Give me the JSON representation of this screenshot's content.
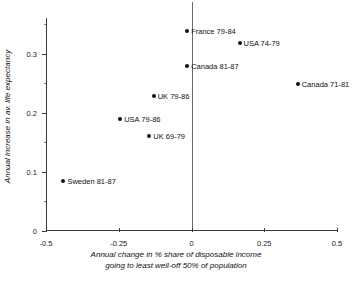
{
  "chart_data": {
    "type": "scatter",
    "title": "",
    "xlabel": "Annual change in % share of disposable income going to least well-off 50% of population",
    "xlabel_line1": "Annual change in % share of disposable income",
    "xlabel_line2": "going to least well-off 50% of population",
    "ylabel": "Annual increase in av. life expectancy",
    "xlim": [
      -0.5,
      0.5
    ],
    "ylim": [
      0,
      0.36
    ],
    "xticks": [
      -0.5,
      -0.25,
      0,
      0.25,
      0.5
    ],
    "xticklabels": [
      "-0.5",
      "-0.25",
      "0",
      "0.25",
      "0.5"
    ],
    "yticks": [
      0,
      0.1,
      0.2,
      0.3
    ],
    "yticklabels": [
      "0",
      "0.1",
      "0.2",
      "0.3"
    ],
    "grid": false,
    "legend": "none",
    "marker_color": "#111111",
    "axis_color": "#3a3a3a",
    "points": [
      {
        "label": "France 79-84",
        "x": -0.015,
        "y": 0.338,
        "label_side": "right"
      },
      {
        "label": "USA 74-79",
        "x": 0.165,
        "y": 0.318,
        "label_side": "right"
      },
      {
        "label": "Canada 81-87",
        "x": -0.015,
        "y": 0.279,
        "label_side": "right"
      },
      {
        "label": "Canada 71-81",
        "x": 0.365,
        "y": 0.248,
        "label_side": "right"
      },
      {
        "label": "UK 79-86",
        "x": -0.13,
        "y": 0.228,
        "label_side": "right"
      },
      {
        "label": "USA 79-86",
        "x": -0.245,
        "y": 0.19,
        "label_side": "right"
      },
      {
        "label": "UK 69-79",
        "x": -0.145,
        "y": 0.16,
        "label_side": "right"
      },
      {
        "label": "Sweden 81-87",
        "x": -0.44,
        "y": 0.085,
        "label_side": "right"
      }
    ]
  }
}
